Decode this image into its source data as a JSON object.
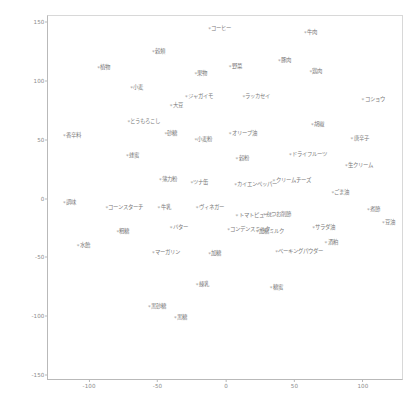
{
  "chart_data": {
    "type": "scatter",
    "title": "",
    "subtitle": "",
    "xlabel": "",
    "ylabel": "",
    "xlim": [
      -130,
      130
    ],
    "ylim": [
      -155,
      155
    ],
    "xticks": [
      "-100",
      "-50",
      "0",
      "50",
      "100"
    ],
    "xtick_values": [
      -100,
      -50,
      0,
      50,
      100
    ],
    "yticks": [
      "150",
      "100",
      "50",
      "0",
      "-50",
      "-100",
      "-150"
    ],
    "ytick_values": [
      150,
      100,
      50,
      0,
      -50,
      -100,
      -150
    ],
    "grid": false,
    "legend": "none",
    "marker": "*",
    "marker_color": "#9a9a9a",
    "label_color": "#7a7a7a",
    "axis_color": "#b9b9b9",
    "background": "#ffffff",
    "points": [
      {
        "label": "コーヒー",
        "x": -12,
        "y": 143
      },
      {
        "label": "牛肉",
        "x": 58,
        "y": 140
      },
      {
        "label": "穀類",
        "x": -53,
        "y": 124
      },
      {
        "label": "豚肉",
        "x": 39,
        "y": 116
      },
      {
        "label": "植物",
        "x": -93,
        "y": 110
      },
      {
        "label": "野菜",
        "x": 3,
        "y": 111
      },
      {
        "label": "鶏肉",
        "x": 62,
        "y": 107
      },
      {
        "label": "果物",
        "x": -22,
        "y": 105
      },
      {
        "label": "小麦",
        "x": -69,
        "y": 93
      },
      {
        "label": "ジャガイモ",
        "x": -29,
        "y": 85
      },
      {
        "label": "ラッカセイ",
        "x": 13,
        "y": 85
      },
      {
        "label": "コショウ",
        "x": 100,
        "y": 83
      },
      {
        "label": "大豆",
        "x": -40,
        "y": 78
      },
      {
        "label": "とうもろこし",
        "x": -71,
        "y": 64
      },
      {
        "label": "胡椒",
        "x": 63,
        "y": 62
      },
      {
        "label": "香辛料",
        "x": -118,
        "y": 52
      },
      {
        "label": "砂糖",
        "x": -44,
        "y": 54
      },
      {
        "label": "小麦粉",
        "x": -22,
        "y": 49
      },
      {
        "label": "オリーブ油",
        "x": 3,
        "y": 54
      },
      {
        "label": "唐辛子",
        "x": 92,
        "y": 50
      },
      {
        "label": "蜂蜜",
        "x": -72,
        "y": 35
      },
      {
        "label": "穀粉",
        "x": 8,
        "y": 33
      },
      {
        "label": "ドライフルーツ",
        "x": 47,
        "y": 36
      },
      {
        "label": "生クリーム",
        "x": 88,
        "y": 27
      },
      {
        "label": "薄力粉",
        "x": -48,
        "y": 15
      },
      {
        "label": "ツナ缶",
        "x": -25,
        "y": 12
      },
      {
        "label": "カイエンペッパー",
        "x": 7,
        "y": 11
      },
      {
        "label": "クリームチーズ",
        "x": 35,
        "y": 14
      },
      {
        "label": "ごま油",
        "x": 78,
        "y": 4
      },
      {
        "label": "調味",
        "x": -118,
        "y": -5
      },
      {
        "label": "コーンスターチ",
        "x": -87,
        "y": -9
      },
      {
        "label": "牛乳",
        "x": -49,
        "y": -9
      },
      {
        "label": "ヴィネガー",
        "x": -21,
        "y": -9
      },
      {
        "label": "トマトピューレ",
        "x": 8,
        "y": -16
      },
      {
        "label": "かつお削節",
        "x": 28,
        "y": -15
      },
      {
        "label": "煮節",
        "x": 104,
        "y": -11
      },
      {
        "label": "粗糖",
        "x": -79,
        "y": -29
      },
      {
        "label": "バター",
        "x": -40,
        "y": -26
      },
      {
        "label": "コンデンスミルク",
        "x": 2,
        "y": -28
      },
      {
        "label": "加糖ミルク",
        "x": 23,
        "y": -29
      },
      {
        "label": "サラダ油",
        "x": 64,
        "y": -26
      },
      {
        "label": "豆油",
        "x": 115,
        "y": -22
      },
      {
        "label": "水飴",
        "x": -108,
        "y": -41
      },
      {
        "label": "酒粕",
        "x": 73,
        "y": -39
      },
      {
        "label": "マーガリン",
        "x": -53,
        "y": -47
      },
      {
        "label": "加糖",
        "x": -12,
        "y": -48
      },
      {
        "label": "ベーキングパウダー",
        "x": 37,
        "y": -46
      },
      {
        "label": "練乳",
        "x": -21,
        "y": -74
      },
      {
        "label": "糖蜜",
        "x": 33,
        "y": -77
      },
      {
        "label": "黒砂糖",
        "x": -56,
        "y": -93
      },
      {
        "label": "黒糖",
        "x": -37,
        "y": -102
      }
    ]
  }
}
